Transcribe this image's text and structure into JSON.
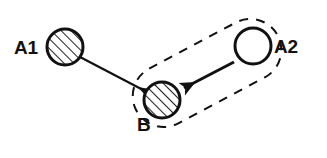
{
  "diagram": {
    "type": "node-link-diagram",
    "title": "",
    "background_color": "#ffffff",
    "stroke_color": "#111111",
    "hatch_color": "#222222",
    "canvas": {
      "width": 327,
      "height": 158
    },
    "nodes": [
      {
        "id": "A1",
        "label": "A1",
        "fill_style": "hatched",
        "hatch_direction": "forward-slash",
        "cx": 65,
        "cy": 47,
        "r": 18,
        "stroke_width": 3,
        "label_x": 14,
        "label_y": 54,
        "label_anchor": "start"
      },
      {
        "id": "B",
        "label": "B",
        "fill_style": "hatched",
        "hatch_direction": "forward-slash",
        "cx": 162,
        "cy": 100,
        "r": 18,
        "stroke_width": 3,
        "label_x": 137,
        "label_y": 131,
        "label_anchor": "start"
      },
      {
        "id": "A2",
        "label": "A2",
        "fill_style": "empty",
        "hatch_direction": "none",
        "cx": 253,
        "cy": 46,
        "r": 18,
        "stroke_width": 3,
        "label_x": 274,
        "label_y": 53,
        "label_anchor": "start"
      }
    ],
    "edges": [
      {
        "id": "A1-to-B",
        "from": "A1",
        "to": "B",
        "style": "solid",
        "arrowhead": "small-open",
        "x1": 80,
        "y1": 57,
        "x2": 147,
        "y2": 92,
        "stroke_width": 2
      },
      {
        "id": "A2-to-B",
        "from": "A2",
        "to": "B",
        "style": "solid",
        "arrowhead": "large-solid",
        "x1": 234,
        "y1": 62,
        "x2": 181,
        "y2": 90,
        "stroke_width": 3
      }
    ],
    "groups": [
      {
        "id": "group-A2-B",
        "shape": "stadium",
        "style": "dashed",
        "contains": [
          "B",
          "A2"
        ],
        "center_x": 207,
        "center_y": 73,
        "length": 160,
        "thickness": 62,
        "rotation_deg": -28,
        "stroke_width": 2,
        "dash_pattern": "9 8"
      }
    ]
  }
}
